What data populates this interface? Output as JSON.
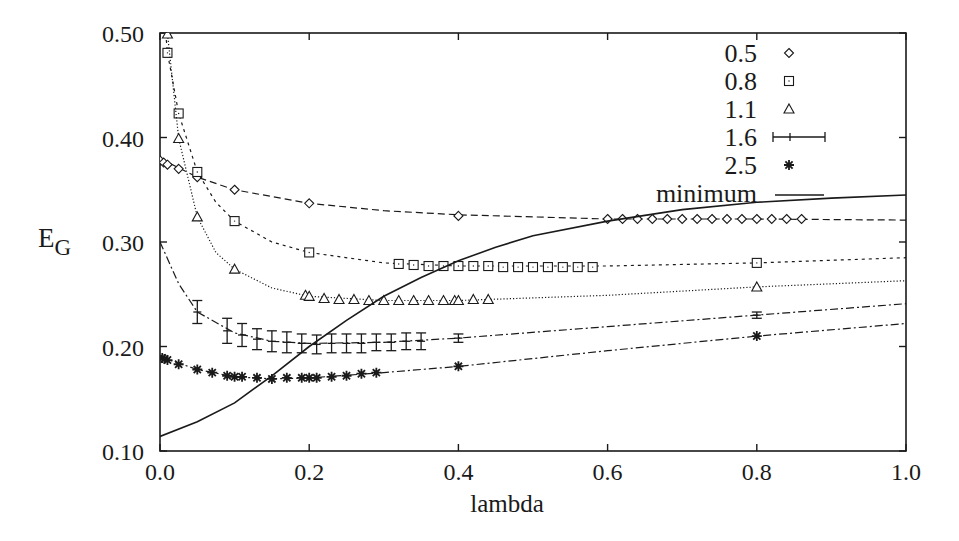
{
  "chart_data": {
    "type": "scatter",
    "title": "",
    "xlabel": "lambda",
    "ylabel": "E_G",
    "ylabel_main": "E",
    "ylabel_sub": "G",
    "xlim": [
      0.0,
      1.0
    ],
    "ylim": [
      0.1,
      0.5
    ],
    "xticks": [
      "0.0",
      "0.2",
      "0.4",
      "0.6",
      "0.8",
      "1.0"
    ],
    "yticks": [
      "0.10",
      "0.20",
      "0.30",
      "0.40",
      "0.50"
    ],
    "grid": false,
    "legend_position": "upper right (inside)",
    "series": [
      {
        "name": "0.5",
        "marker": "diamond",
        "line": "dashed",
        "points": [
          [
            0.0,
            0.378
          ],
          [
            0.005,
            0.376
          ],
          [
            0.01,
            0.374
          ],
          [
            0.025,
            0.37
          ],
          [
            0.05,
            0.362
          ],
          [
            0.1,
            0.35
          ],
          [
            0.2,
            0.337
          ],
          [
            0.4,
            0.325
          ],
          [
            0.6,
            0.322
          ],
          [
            0.62,
            0.322
          ],
          [
            0.64,
            0.322
          ],
          [
            0.66,
            0.322
          ],
          [
            0.68,
            0.322
          ],
          [
            0.7,
            0.322
          ],
          [
            0.72,
            0.322
          ],
          [
            0.74,
            0.322
          ],
          [
            0.76,
            0.322
          ],
          [
            0.78,
            0.322
          ],
          [
            0.8,
            0.322
          ],
          [
            0.82,
            0.322
          ],
          [
            0.84,
            0.322
          ],
          [
            0.86,
            0.322
          ]
        ],
        "fit": [
          [
            0.0,
            0.38
          ],
          [
            0.05,
            0.362
          ],
          [
            0.1,
            0.35
          ],
          [
            0.2,
            0.337
          ],
          [
            0.3,
            0.33
          ],
          [
            0.4,
            0.326
          ],
          [
            0.5,
            0.324
          ],
          [
            0.6,
            0.322
          ],
          [
            0.8,
            0.322
          ],
          [
            1.0,
            0.321
          ]
        ]
      },
      {
        "name": "0.8",
        "marker": "square",
        "line": "short-dashed",
        "points": [
          [
            0.01,
            0.481
          ],
          [
            0.025,
            0.423
          ],
          [
            0.05,
            0.367
          ],
          [
            0.1,
            0.32
          ],
          [
            0.2,
            0.29
          ],
          [
            0.32,
            0.279
          ],
          [
            0.34,
            0.278
          ],
          [
            0.36,
            0.277
          ],
          [
            0.38,
            0.277
          ],
          [
            0.4,
            0.277
          ],
          [
            0.42,
            0.277
          ],
          [
            0.44,
            0.277
          ],
          [
            0.46,
            0.276
          ],
          [
            0.48,
            0.276
          ],
          [
            0.5,
            0.276
          ],
          [
            0.52,
            0.276
          ],
          [
            0.54,
            0.276
          ],
          [
            0.56,
            0.276
          ],
          [
            0.58,
            0.276
          ],
          [
            0.8,
            0.28
          ]
        ],
        "fit": [
          [
            0.005,
            0.52
          ],
          [
            0.01,
            0.481
          ],
          [
            0.025,
            0.423
          ],
          [
            0.05,
            0.367
          ],
          [
            0.075,
            0.338
          ],
          [
            0.1,
            0.32
          ],
          [
            0.15,
            0.3
          ],
          [
            0.2,
            0.29
          ],
          [
            0.3,
            0.28
          ],
          [
            0.4,
            0.277
          ],
          [
            0.6,
            0.277
          ],
          [
            0.8,
            0.28
          ],
          [
            1.0,
            0.285
          ]
        ]
      },
      {
        "name": "1.1",
        "marker": "triangle",
        "line": "dotted",
        "points": [
          [
            0.01,
            0.499
          ],
          [
            0.025,
            0.399
          ],
          [
            0.05,
            0.324
          ],
          [
            0.1,
            0.274
          ],
          [
            0.195,
            0.249
          ],
          [
            0.2,
            0.248
          ],
          [
            0.22,
            0.246
          ],
          [
            0.24,
            0.245
          ],
          [
            0.26,
            0.245
          ],
          [
            0.28,
            0.244
          ],
          [
            0.3,
            0.244
          ],
          [
            0.32,
            0.244
          ],
          [
            0.34,
            0.244
          ],
          [
            0.36,
            0.244
          ],
          [
            0.38,
            0.244
          ],
          [
            0.395,
            0.244
          ],
          [
            0.4,
            0.244
          ],
          [
            0.42,
            0.245
          ],
          [
            0.44,
            0.245
          ],
          [
            0.8,
            0.257
          ]
        ],
        "fit": [
          [
            0.008,
            0.52
          ],
          [
            0.01,
            0.499
          ],
          [
            0.025,
            0.399
          ],
          [
            0.05,
            0.324
          ],
          [
            0.075,
            0.29
          ],
          [
            0.1,
            0.274
          ],
          [
            0.15,
            0.256
          ],
          [
            0.2,
            0.248
          ],
          [
            0.3,
            0.244
          ],
          [
            0.4,
            0.244
          ],
          [
            0.6,
            0.249
          ],
          [
            0.8,
            0.257
          ],
          [
            1.0,
            0.263
          ]
        ]
      },
      {
        "name": "1.6",
        "marker": "errorbar",
        "line": "dash-dot",
        "points": [
          [
            0.05,
            0.233,
            0.011
          ],
          [
            0.09,
            0.215,
            0.012
          ],
          [
            0.11,
            0.211,
            0.011
          ],
          [
            0.13,
            0.207,
            0.01
          ],
          [
            0.15,
            0.205,
            0.01
          ],
          [
            0.17,
            0.204,
            0.01
          ],
          [
            0.19,
            0.203,
            0.009
          ],
          [
            0.21,
            0.202,
            0.009
          ],
          [
            0.23,
            0.203,
            0.009
          ],
          [
            0.25,
            0.203,
            0.009
          ],
          [
            0.27,
            0.203,
            0.009
          ],
          [
            0.29,
            0.204,
            0.008
          ],
          [
            0.31,
            0.204,
            0.008
          ],
          [
            0.33,
            0.205,
            0.008
          ],
          [
            0.35,
            0.205,
            0.008
          ],
          [
            0.4,
            0.208,
            0.004
          ],
          [
            0.8,
            0.23,
            0.003
          ]
        ],
        "fit": [
          [
            0.0,
            0.3
          ],
          [
            0.025,
            0.26
          ],
          [
            0.05,
            0.233
          ],
          [
            0.1,
            0.213
          ],
          [
            0.15,
            0.205
          ],
          [
            0.2,
            0.203
          ],
          [
            0.3,
            0.204
          ],
          [
            0.4,
            0.208
          ],
          [
            0.6,
            0.219
          ],
          [
            0.8,
            0.23
          ],
          [
            1.0,
            0.241
          ]
        ]
      },
      {
        "name": "2.5",
        "marker": "star",
        "line": "dash-dot",
        "points": [
          [
            0.003,
            0.189
          ],
          [
            0.006,
            0.188
          ],
          [
            0.01,
            0.187
          ],
          [
            0.025,
            0.183
          ],
          [
            0.05,
            0.178
          ],
          [
            0.07,
            0.175
          ],
          [
            0.09,
            0.172
          ],
          [
            0.1,
            0.171
          ],
          [
            0.11,
            0.171
          ],
          [
            0.13,
            0.17
          ],
          [
            0.15,
            0.169
          ],
          [
            0.17,
            0.17
          ],
          [
            0.19,
            0.17
          ],
          [
            0.2,
            0.17
          ],
          [
            0.21,
            0.17
          ],
          [
            0.23,
            0.171
          ],
          [
            0.25,
            0.172
          ],
          [
            0.27,
            0.174
          ],
          [
            0.29,
            0.175
          ],
          [
            0.4,
            0.181
          ],
          [
            0.8,
            0.21
          ]
        ],
        "fit": [
          [
            0.0,
            0.19
          ],
          [
            0.05,
            0.178
          ],
          [
            0.1,
            0.171
          ],
          [
            0.15,
            0.169
          ],
          [
            0.2,
            0.17
          ],
          [
            0.3,
            0.175
          ],
          [
            0.4,
            0.181
          ],
          [
            0.6,
            0.196
          ],
          [
            0.8,
            0.21
          ],
          [
            1.0,
            0.222
          ]
        ]
      },
      {
        "name": "minimum",
        "marker": "none",
        "line": "solid",
        "points": [
          [
            0.0,
            0.114
          ],
          [
            0.05,
            0.128
          ],
          [
            0.1,
            0.146
          ],
          [
            0.15,
            0.172
          ],
          [
            0.2,
            0.2
          ],
          [
            0.25,
            0.225
          ],
          [
            0.3,
            0.248
          ],
          [
            0.35,
            0.266
          ],
          [
            0.4,
            0.282
          ],
          [
            0.45,
            0.295
          ],
          [
            0.5,
            0.306
          ],
          [
            0.6,
            0.32
          ],
          [
            0.7,
            0.331
          ],
          [
            0.8,
            0.338
          ],
          [
            0.9,
            0.342
          ],
          [
            1.0,
            0.345
          ]
        ]
      }
    ]
  },
  "legend": {
    "entries": [
      {
        "label": "0.5",
        "marker": "diamond"
      },
      {
        "label": "0.8",
        "marker": "square"
      },
      {
        "label": "1.1",
        "marker": "triangle"
      },
      {
        "label": "1.6",
        "marker": "errorbar"
      },
      {
        "label": "2.5",
        "marker": "star"
      },
      {
        "label": "minimum",
        "marker": "line"
      }
    ]
  },
  "colors": {
    "ink": "#1a1a1a",
    "background": "#ffffff"
  }
}
